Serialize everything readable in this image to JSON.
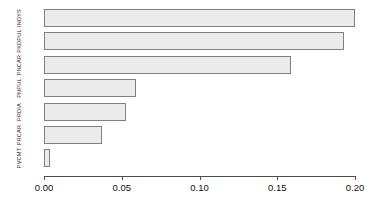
{
  "chart_data": {
    "type": "bar",
    "orientation": "horizontal",
    "title": "",
    "subtitle": "",
    "xlabel": "",
    "ylabel": "",
    "categories": [
      "INDYS",
      "PKDPUL",
      "PNCAR",
      "PNPUL",
      "PRDIA",
      "PRCAR",
      "PVCMT"
    ],
    "values": [
      0.2,
      0.193,
      0.159,
      0.059,
      0.053,
      0.037,
      0.004
    ],
    "series": [
      {
        "name": "value",
        "values": [
          0.2,
          0.193,
          0.159,
          0.059,
          0.053,
          0.037,
          0.004
        ]
      }
    ],
    "xlim": [
      0.0,
      0.2
    ],
    "ylim": [
      0,
      7
    ],
    "xticks": [
      0.0,
      0.05,
      0.1,
      0.15,
      0.2
    ],
    "xtick_labels": [
      "0.00",
      "0.05",
      "0.10",
      "0.15",
      "0.20"
    ],
    "grid": false,
    "legend": false,
    "legend_position": "none",
    "bar_fill_color": "#ebebeb",
    "bar_border_color": "#808080",
    "axis_color": "#4d4d4d",
    "background_color": "#ffffff"
  }
}
